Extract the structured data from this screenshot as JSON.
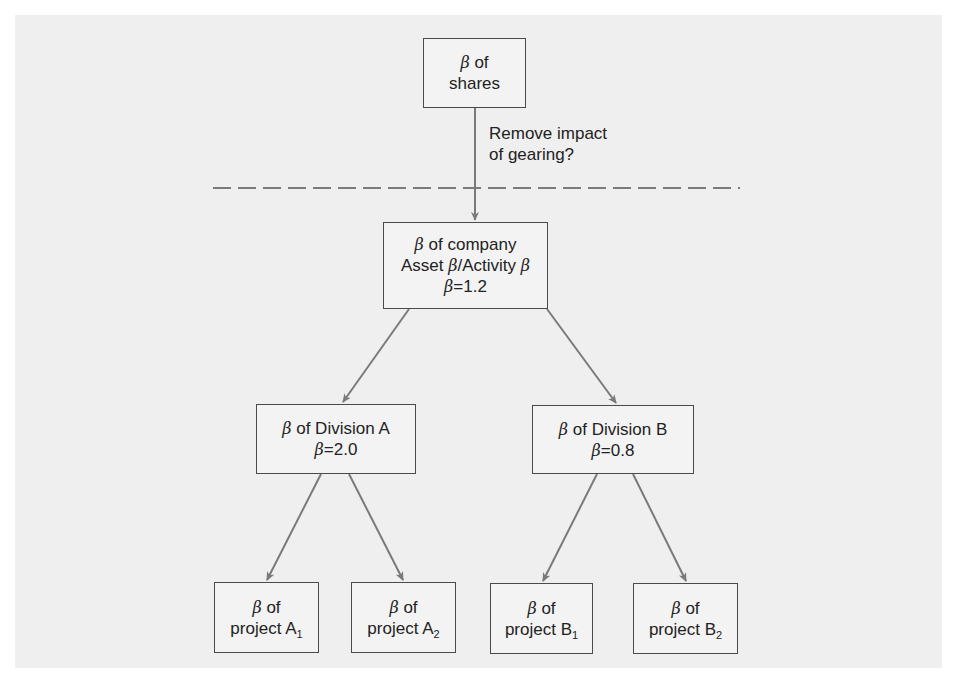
{
  "diagram": {
    "title": "",
    "colors": {
      "background": "#efefef",
      "box_fill": "#f3f3f3",
      "box_border": "#4a4a4a",
      "arrow": "#7a7a7a",
      "dash": "#555555"
    },
    "nodes": {
      "shares": {
        "line1_prefix": "β",
        "line1_text": " of",
        "line2_text": "shares"
      },
      "company": {
        "line1_prefix": "β",
        "line1_text": " of company",
        "line2_a": "Asset ",
        "line2_b": "β",
        "line2_c": "/Activity ",
        "line2_d": "β",
        "line3_prefix": "β",
        "line3_text": "=1.2",
        "beta_value": 1.2
      },
      "division_a": {
        "line1_prefix": "β",
        "line1_text": " of Division A",
        "line2_prefix": "β",
        "line2_text": "=2.0",
        "beta_value": 2.0
      },
      "division_b": {
        "line1_prefix": "β",
        "line1_text": " of Division B",
        "line2_prefix": "β",
        "line2_text": "=0.8",
        "beta_value": 0.8
      },
      "project_a1": {
        "line1_prefix": "β",
        "line1_text": " of",
        "line2_text": "project A",
        "subscript": "1"
      },
      "project_a2": {
        "line1_prefix": "β",
        "line1_text": " of",
        "line2_text": "project A",
        "subscript": "2"
      },
      "project_b1": {
        "line1_prefix": "β",
        "line1_text": " of",
        "line2_text": "project B",
        "subscript": "1"
      },
      "project_b2": {
        "line1_prefix": "β",
        "line1_text": " of",
        "line2_text": "project B",
        "subscript": "2"
      }
    },
    "edge_label": {
      "line1": "Remove impact",
      "line2": "of gearing?"
    },
    "edges": [
      {
        "from": "shares",
        "to": "company",
        "label": "Remove impact of gearing?"
      },
      {
        "from": "company",
        "to": "division_a"
      },
      {
        "from": "company",
        "to": "division_b"
      },
      {
        "from": "division_a",
        "to": "project_a1"
      },
      {
        "from": "division_a",
        "to": "project_a2"
      },
      {
        "from": "division_b",
        "to": "project_b1"
      },
      {
        "from": "division_b",
        "to": "project_b2"
      }
    ],
    "separator": "dashed horizontal line"
  }
}
